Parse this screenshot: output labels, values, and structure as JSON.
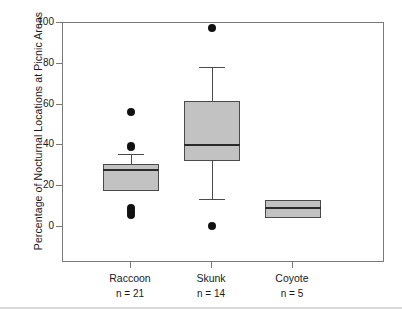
{
  "chart_data": {
    "type": "box",
    "title": "",
    "xlabel": "",
    "ylabel": "Percentage of Nocturnal Locations at Picnic Areas",
    "ylim": [
      0,
      100
    ],
    "yticks": [
      0,
      20,
      40,
      60,
      80,
      100
    ],
    "ytick_labels": [
      "0",
      "20",
      "40",
      "60",
      "80",
      "100"
    ],
    "grid": false,
    "legend": "none",
    "categories": [
      "Raccoon",
      "Skunk",
      "Coyote"
    ],
    "sample_sizes": [
      "n = 21",
      "n = 14",
      "n = 5"
    ],
    "boxes": [
      {
        "category": "Raccoon",
        "n_label": "n = 21",
        "whisker_low": 17.5,
        "q1": 17.5,
        "median": 28.0,
        "q3": 31.0,
        "whisker_high": 36.0,
        "outliers": [
          56.5,
          39.5,
          9.0,
          7.5,
          6.0
        ]
      },
      {
        "category": "Skunk",
        "n_label": "n = 14",
        "whisker_low": 13.5,
        "q1": 32.5,
        "median": 40.0,
        "q3": 62.0,
        "whisker_high": 78.5,
        "outliers": [
          97.5,
          0.5
        ]
      },
      {
        "category": "Coyote",
        "n_label": "n = 5",
        "whisker_low": 4.5,
        "q1": 4.5,
        "median": 9.5,
        "q3": 13.0,
        "whisker_high": 13.0,
        "outliers": []
      }
    ],
    "colors": {
      "box_fill": "#c2c2c2",
      "box_edge": "#4a4a4a",
      "median": "#2b2b2b",
      "outlier": "#111111",
      "axis": "#7a7a7a",
      "text": "#1a1a1a",
      "background": "#ffffff"
    }
  }
}
